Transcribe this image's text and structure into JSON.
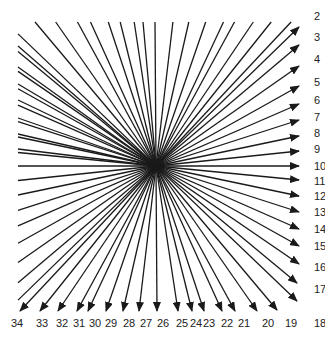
{
  "diagram": {
    "type": "radial-arrow-fan",
    "center": [
      156,
      166
    ],
    "line_color": "#1a1a1a",
    "label_color": "#222222",
    "background": "#ffffff",
    "arrows": [
      {
        "label": "2",
        "start": [
          193,
          152
        ],
        "tip": [
          299,
          27
        ],
        "label_pos": [
          314,
          20
        ]
      },
      {
        "label": "3",
        "start": [
          208,
          22
        ],
        "tip": [
          299,
          45
        ],
        "label_pos": [
          314,
          41
        ]
      },
      {
        "label": "4",
        "start": [
          224,
          22
        ],
        "tip": [
          299,
          66
        ],
        "label_pos": [
          314,
          63
        ]
      },
      {
        "label": "5",
        "start": [
          242,
          22
        ],
        "tip": [
          299,
          86
        ],
        "label_pos": [
          314,
          86
        ]
      },
      {
        "label": "6",
        "start": [
          257,
          22
        ],
        "tip": [
          299,
          104
        ],
        "label_pos": [
          314,
          104
        ]
      },
      {
        "label": "7",
        "start": [
          275,
          22
        ],
        "tip": [
          299,
          120
        ],
        "label_pos": [
          314,
          121
        ]
      },
      {
        "label": "8",
        "start": [
          290,
          36
        ],
        "tip": [
          299,
          136
        ],
        "label_pos": [
          314,
          137
        ]
      },
      {
        "label": "9",
        "start": [
          290,
          58
        ],
        "tip": [
          299,
          151
        ],
        "label_pos": [
          314,
          153
        ]
      },
      {
        "label": "10",
        "start": [
          18,
          166
        ],
        "tip": [
          299,
          166
        ],
        "label_pos": [
          314,
          170
        ]
      },
      {
        "label": "11",
        "start": [
          18,
          183
        ],
        "tip": [
          299,
          180
        ],
        "label_pos": [
          314,
          185
        ]
      },
      {
        "label": "12",
        "start": [
          18,
          196
        ],
        "tip": [
          299,
          196
        ],
        "label_pos": [
          314,
          200
        ]
      },
      {
        "label": "13",
        "start": [
          18,
          214
        ],
        "tip": [
          299,
          212
        ],
        "label_pos": [
          314,
          216
        ]
      },
      {
        "label": "14",
        "start": [
          18,
          231
        ],
        "tip": [
          299,
          229
        ],
        "label_pos": [
          314,
          233
        ]
      },
      {
        "label": "15",
        "start": [
          18,
          250
        ],
        "tip": [
          299,
          246
        ],
        "label_pos": [
          314,
          250
        ]
      },
      {
        "label": "16",
        "start": [
          18,
          265
        ],
        "tip": [
          299,
          264
        ],
        "label_pos": [
          314,
          271
        ]
      },
      {
        "label": "17",
        "start": [
          18,
          285
        ],
        "tip": [
          297,
          283
        ],
        "label_pos": [
          314,
          293
        ]
      },
      {
        "label": "18",
        "start": [
          18,
          298
        ],
        "tip": [
          297,
          301
        ],
        "label_pos": [
          314,
          327
        ]
      },
      {
        "label": "19",
        "start": [
          22,
          22
        ],
        "tip": [
          277,
          310
        ],
        "label_pos": [
          285,
          327
        ]
      },
      {
        "label": "20",
        "start": [
          44,
          22
        ],
        "tip": [
          257,
          311
        ],
        "label_pos": [
          262,
          327
        ]
      },
      {
        "label": "21",
        "start": [
          65,
          22
        ],
        "tip": [
          235,
          311
        ],
        "label_pos": [
          238,
          327
        ]
      },
      {
        "label": "22",
        "start": [
          83,
          22
        ],
        "tip": [
          222,
          311
        ],
        "label_pos": [
          221,
          327
        ]
      },
      {
        "label": "23",
        "start": [
          97,
          22
        ],
        "tip": [
          204,
          311
        ],
        "label_pos": [
          203,
          327
        ]
      },
      {
        "label": "24",
        "start": [
          113,
          22
        ],
        "tip": [
          192,
          311
        ],
        "label_pos": [
          190,
          327
        ]
      },
      {
        "label": "25",
        "start": [
          127,
          22
        ],
        "tip": [
          178,
          311
        ],
        "label_pos": [
          176,
          327
        ]
      },
      {
        "label": "26",
        "start": [
          160,
          22
        ],
        "tip": [
          157,
          311
        ],
        "label_pos": [
          157,
          327
        ]
      },
      {
        "label": "27",
        "start": [
          177,
          22
        ],
        "tip": [
          139,
          311
        ],
        "label_pos": [
          140,
          327
        ]
      },
      {
        "label": "28",
        "start": [
          193,
          22
        ],
        "tip": [
          123,
          311
        ],
        "label_pos": [
          123,
          327
        ]
      },
      {
        "label": "29",
        "start": [
          208,
          22
        ],
        "tip": [
          106,
          311
        ],
        "label_pos": [
          105,
          327
        ]
      },
      {
        "label": "30",
        "start": [
          224,
          22
        ],
        "tip": [
          88,
          311
        ],
        "label_pos": [
          89,
          327
        ]
      },
      {
        "label": "31",
        "start": [
          242,
          22
        ],
        "tip": [
          77,
          311
        ],
        "label_pos": [
          73,
          327
        ]
      },
      {
        "label": "32",
        "start": [
          257,
          22
        ],
        "tip": [
          58,
          311
        ],
        "label_pos": [
          56,
          327
        ]
      },
      {
        "label": "33",
        "start": [
          275,
          22
        ],
        "tip": [
          40,
          311
        ],
        "label_pos": [
          36,
          327
        ]
      },
      {
        "label": "34",
        "start": [
          290,
          22
        ],
        "tip": [
          20,
          311
        ],
        "label_pos": [
          11,
          327
        ]
      }
    ],
    "plain_lines": [
      {
        "start": [
          143,
          22
        ]
      },
      {
        "start": [
          18,
          46
        ]
      },
      {
        "start": [
          18,
          67
        ]
      },
      {
        "start": [
          18,
          84
        ]
      },
      {
        "start": [
          18,
          100
        ]
      },
      {
        "start": [
          18,
          118
        ]
      },
      {
        "start": [
          18,
          134
        ]
      },
      {
        "start": [
          18,
          149
        ]
      }
    ]
  }
}
